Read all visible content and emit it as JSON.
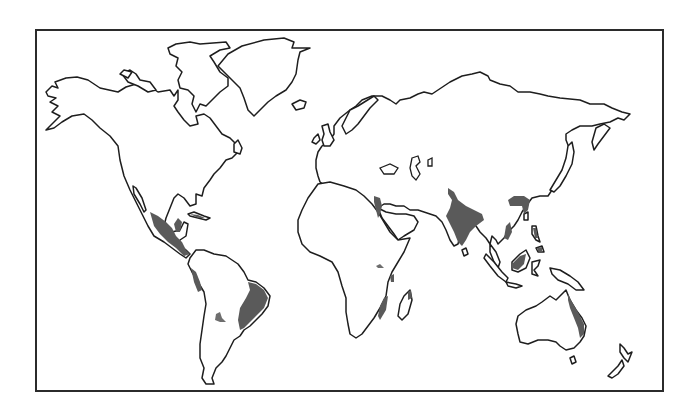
{
  "map": {
    "type": "world-outline-map",
    "projection": "equirectangular-style outline",
    "frame": {
      "x": 36,
      "y": 30,
      "width": 627,
      "height": 361,
      "stroke": "#2b2b2b"
    },
    "colors": {
      "background": "#ffffff",
      "land_fill": "#ffffff",
      "coastline": "#1e1e1e",
      "highlight_fill": "#5a5a5a",
      "highlight_fill_light": "#6e6e6e"
    },
    "legend": null,
    "title": null,
    "highlighted_regions": [
      {
        "id": "mexico-central-america",
        "name": "Western Mexico / Central America"
      },
      {
        "id": "caribbean-cuba",
        "name": "Cuba / Caribbean"
      },
      {
        "id": "ecuador-peru-coast",
        "name": "Western South America coast"
      },
      {
        "id": "eastern-brazil",
        "name": "Eastern Brazil"
      },
      {
        "id": "paraguay-inland",
        "name": "Inland South America (Paraguay)"
      },
      {
        "id": "nile-egypt",
        "name": "Nile Valley / Egypt"
      },
      {
        "id": "east-africa-highland",
        "name": "East African highland"
      },
      {
        "id": "east-africa-coast",
        "name": "East African coast"
      },
      {
        "id": "southeast-africa",
        "name": "Southeast Africa (Mozambique)"
      },
      {
        "id": "madagascar-east",
        "name": "Eastern Madagascar"
      },
      {
        "id": "indian-subcontinent",
        "name": "Indian subcontinent"
      },
      {
        "id": "china-south",
        "name": "Southern China"
      },
      {
        "id": "indochina",
        "name": "Indochina"
      },
      {
        "id": "philippines",
        "name": "Philippines"
      },
      {
        "id": "borneo",
        "name": "Borneo"
      },
      {
        "id": "eastern-australia",
        "name": "Eastern Australia (Queensland)"
      }
    ]
  }
}
